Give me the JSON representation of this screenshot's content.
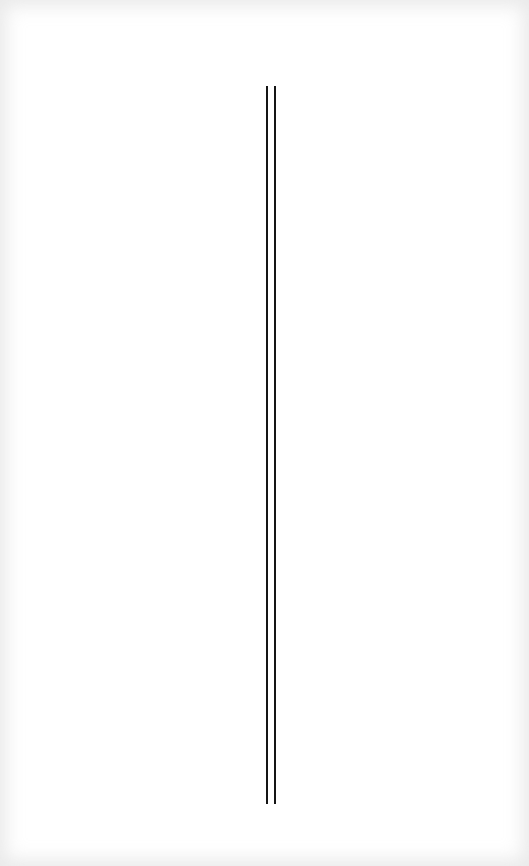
{
  "page": {
    "background_color": "#ffffff",
    "edge_tint_color": "#efefef"
  },
  "rules": [
    {
      "name": "left-vertical-rule",
      "x": 266,
      "top": 86,
      "bottom": 804,
      "width": 2,
      "color": "#151515"
    },
    {
      "name": "right-vertical-rule",
      "x": 274,
      "top": 86,
      "bottom": 804,
      "width": 2,
      "color": "#151515"
    }
  ]
}
